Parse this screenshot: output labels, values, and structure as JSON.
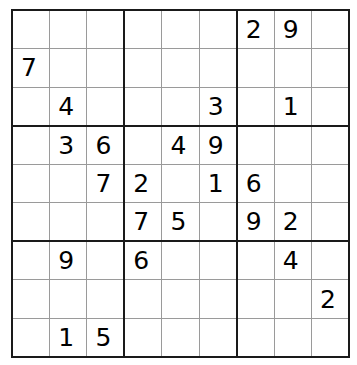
{
  "app": {
    "title": "Sudoku",
    "grid_size": 9,
    "box_size": 3
  },
  "style": {
    "background_color": "#ffffff",
    "thin_line_color": "#9a9a9a",
    "thick_line_color": "#1a1a1a",
    "digit_color": "#000000"
  },
  "puzzle": {
    "rows": [
      [
        "",
        "",
        "",
        "",
        "",
        "",
        "2",
        "9",
        ""
      ],
      [
        "7",
        "",
        "",
        "",
        "",
        "",
        "",
        "",
        ""
      ],
      [
        "",
        "4",
        "",
        "",
        "",
        "3",
        "",
        "1",
        ""
      ],
      [
        "",
        "3",
        "6",
        "",
        "4",
        "9",
        "",
        "",
        ""
      ],
      [
        "",
        "",
        "7",
        "2",
        "",
        "1",
        "6",
        "",
        ""
      ],
      [
        "",
        "",
        "",
        "7",
        "5",
        "",
        "9",
        "2",
        ""
      ],
      [
        "",
        "9",
        "",
        "6",
        "",
        "",
        "",
        "4",
        ""
      ],
      [
        "",
        "",
        "",
        "",
        "",
        "",
        "",
        "",
        "2"
      ],
      [
        "",
        "1",
        "5",
        "",
        "",
        "",
        "",
        "",
        ""
      ]
    ],
    "given_count": 23,
    "empty_count": 58
  }
}
